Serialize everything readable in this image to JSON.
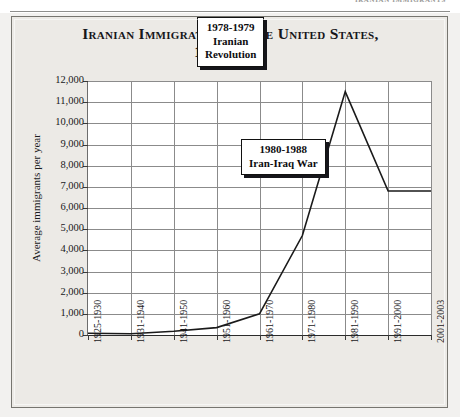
{
  "page": {
    "running_head": "IRANIAN IMMIGRANTS"
  },
  "figure": {
    "title_line1": "Iranian Immigration to the United States,",
    "title_line2": "1925-2003"
  },
  "chart_data": {
    "type": "line",
    "title": "Iranian Immigration to the United States, 1925-2003",
    "xlabel": "",
    "ylabel": "Average immigrants per year",
    "ylim": [
      0,
      12000
    ],
    "ytick_labels": [
      "12,000",
      "11,000",
      "10,000",
      "9,000",
      "8,000",
      "7,000",
      "6,000",
      "5,000",
      "4,000",
      "3,000",
      "2,000",
      "1,000",
      "0"
    ],
    "ytick_values": [
      12000,
      11000,
      10000,
      9000,
      8000,
      7000,
      6000,
      5000,
      4000,
      3000,
      2000,
      1000,
      0
    ],
    "grid": true,
    "legend": "none",
    "categories": [
      "1925-1930",
      "1931-1940",
      "1941-1950",
      "1951-1960",
      "1961-1970",
      "1971-1980",
      "1981-1990",
      "1991-2000",
      "2001-2003"
    ],
    "values": [
      80,
      60,
      180,
      350,
      1000,
      4700,
      11500,
      6800,
      6800
    ],
    "annotations": [
      {
        "name": "iranian-revolution",
        "line1": "1978-1979",
        "line2": "Iranian",
        "line3": "Revolution"
      },
      {
        "name": "iran-iraq-war",
        "line1": "1980-1988",
        "line2": "Iran-Iraq War",
        "line3": ""
      }
    ]
  },
  "colors": {
    "series_line": "#1a1a1a",
    "gridline": "#8b8b8b",
    "frame_border": "#76756f",
    "figure_background": "#eceae6",
    "plot_background": "#ffffff",
    "text": "#18181b"
  }
}
